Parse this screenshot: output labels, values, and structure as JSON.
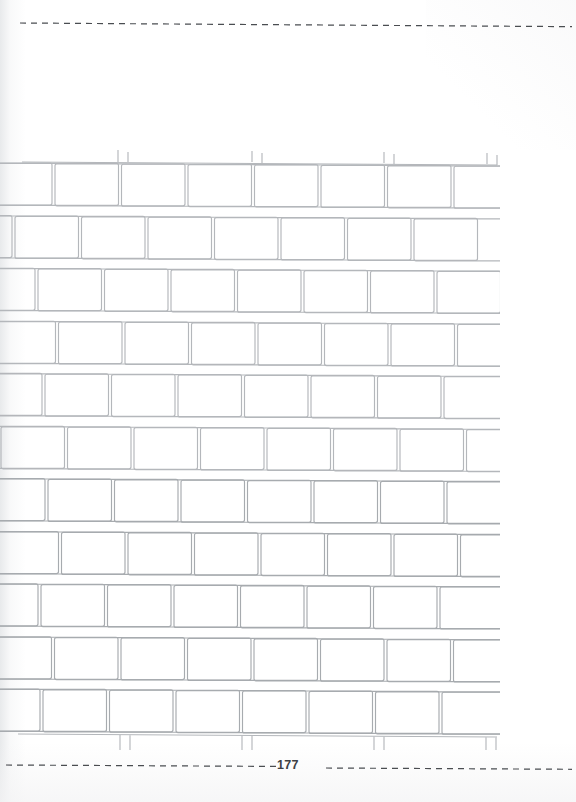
{
  "page": {
    "width": 576,
    "height": 802,
    "background_color": "#ffffff",
    "number_label": "177",
    "number_color": "#3d4044"
  },
  "trim_guides": {
    "stroke_color": "#4a4d51",
    "dash_pattern": "6 5",
    "top": {
      "name": "top-trim-line",
      "x": 20,
      "y": 22,
      "length": 552,
      "tilt_deg": 0.38
    },
    "bottom_left": {
      "name": "bottom-trim-line-left",
      "x": 6,
      "y": 764,
      "length": 270,
      "tilt_deg": 0.3
    },
    "bottom_right": {
      "name": "bottom-trim-line-right",
      "x": 326,
      "y": 767,
      "length": 246,
      "tilt_deg": 0.3
    }
  },
  "brick_wall": {
    "origin_x": 0,
    "origin_y": 150,
    "clip_width": 500,
    "clip_height": 600,
    "stroke_color": "#b4b7bb",
    "stroke_width": 1.15,
    "corner_radius": 2,
    "row_pitch": 53,
    "brick_height": 42,
    "brick_width": 130,
    "mortar_gap": 11,
    "rows": [
      {
        "index": 0,
        "y": 12,
        "offset": -78,
        "type": "clipped-top"
      },
      {
        "index": 1,
        "y": 12,
        "offset": -78,
        "type": "full"
      },
      {
        "index": 2,
        "y": 65,
        "offset": -130,
        "type": "full"
      },
      {
        "index": 3,
        "y": 118,
        "offset": -95,
        "type": "full"
      },
      {
        "index": 4,
        "y": 171,
        "offset": -141,
        "type": "full"
      },
      {
        "index": 5,
        "y": 224,
        "offset": -88,
        "type": "full"
      },
      {
        "index": 6,
        "y": 277,
        "offset": -132,
        "type": "full"
      },
      {
        "index": 7,
        "y": 330,
        "offset": -85,
        "type": "full"
      },
      {
        "index": 8,
        "y": 383,
        "offset": -138,
        "type": "full"
      },
      {
        "index": 9,
        "y": 436,
        "offset": -92,
        "type": "full"
      },
      {
        "index": 10,
        "y": 489,
        "offset": -145,
        "type": "full"
      },
      {
        "index": 11,
        "y": 542,
        "offset": -90,
        "type": "full"
      },
      {
        "index": 12,
        "y": 585,
        "offset": -130,
        "type": "clipped-bottom"
      }
    ]
  }
}
